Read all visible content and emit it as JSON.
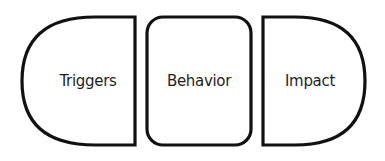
{
  "diagram": {
    "shapes": [
      {
        "id": "triggers",
        "label": "Triggers",
        "shape": "left-rounded-half-stadium"
      },
      {
        "id": "behavior",
        "label": "Behavior",
        "shape": "rounded-rectangle"
      },
      {
        "id": "impact",
        "label": "Impact",
        "shape": "right-rounded-half-stadium"
      }
    ],
    "colors": {
      "stroke": "#111111",
      "fill": "#ffffff",
      "text": "#1e1e1e"
    }
  }
}
